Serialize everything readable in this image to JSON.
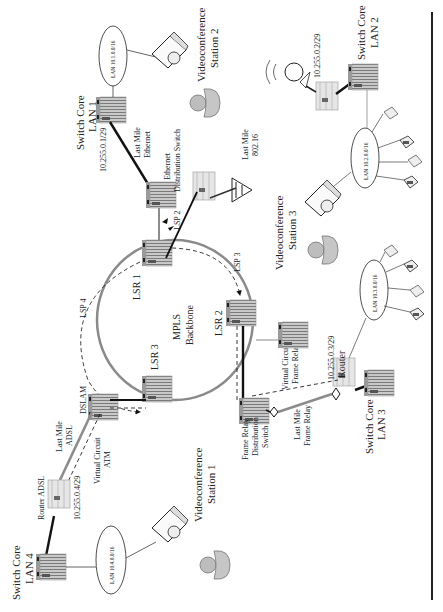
{
  "diagram": {
    "orientation": "rotated 90° counter-clockwise",
    "backbone": {
      "title_line1": "MPLS",
      "title_line2": "Backbone",
      "ring_color": "#8a8a8a",
      "routers": [
        {
          "id": "lsr1",
          "label": "LSR 1"
        },
        {
          "id": "lsr2",
          "label": "LSR 2"
        },
        {
          "id": "lsr3",
          "label": "LSR 3"
        }
      ],
      "lsps": [
        {
          "id": "lsp1",
          "label": "LSP 2"
        },
        {
          "id": "lsp3",
          "label": "LSP 3"
        },
        {
          "id": "lsp4",
          "label": "LSP 4"
        }
      ]
    },
    "sites": {
      "lan1": {
        "switch_label_line1": "Switch Core",
        "switch_label_line2": "LAN 1",
        "lan_label": "LAN 10.1.0.0/16",
        "link_ip": "10.255.0.1/29",
        "last_mile_line1": "Last Mile",
        "last_mile_line2": "Ethernet",
        "dist_switch_line1": "Ethernet",
        "dist_switch_line2": "Distribution Switch"
      },
      "lan2": {
        "switch_label_line1": "Switch Core",
        "switch_label_line2": "LAN 2",
        "lan_label": "LAN 10.2.0.0/16",
        "link_ip": "10.255.0.2/29",
        "last_mile_line1": "Last Mile",
        "last_mile_line2": "802.16"
      },
      "lan3": {
        "switch_label_line1": "Switch Core",
        "switch_label_line2": "LAN 3",
        "lan_label": "LAN 10.3.0.0/16",
        "link_ip": "10.255.0.3/29",
        "router_label": "Router",
        "last_mile_line1": "Last Mile",
        "last_mile_line2": "Frame Relay",
        "vc_line1": "Virtual Circuit",
        "vc_line2": "Frame Relay",
        "dist_switch_line1": "Frame Relay",
        "dist_switch_line2": "Distribution",
        "dist_switch_line3": "Switch"
      },
      "lan4": {
        "switch_label_line1": "Switch Core",
        "switch_label_line2": "LAN 4",
        "lan_label": "LAN 10.4.0.0/16",
        "link_ip": "10.255.0.4/29",
        "router_label": "Router ADSL",
        "last_mile_line1": "Last Mile",
        "last_mile_line2": "ADSL",
        "vc_line1": "Virtual Circuit",
        "vc_line2": "ATM",
        "dslam_label": "DSLAM"
      }
    },
    "videoconference": [
      {
        "line1": "Videoconference",
        "line2": "Station 1"
      },
      {
        "line1": "Videoconference",
        "line2": "Station 2"
      },
      {
        "line1": "Videoconference",
        "line2": "Station 3"
      }
    ],
    "colors": {
      "device_fill": "#c8c8c8",
      "device_stripe": "#7a7a7a",
      "person_fill": "#bdbdbd",
      "link_dark": "#111111",
      "link_gray": "#8c8c8c"
    }
  }
}
